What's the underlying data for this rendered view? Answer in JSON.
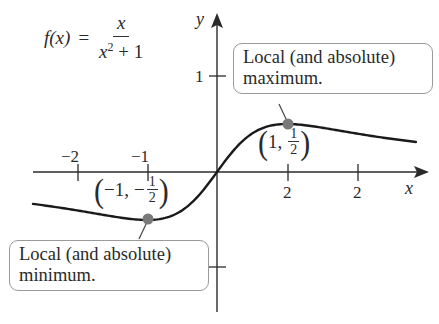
{
  "formula": {
    "lhs": "f(x)",
    "eq": "=",
    "numerator": "x",
    "denominator_base": "x",
    "denominator_exp": "2",
    "denominator_rest": " + 1"
  },
  "axes": {
    "x_label": "x",
    "y_label": "y"
  },
  "ticks": {
    "x": [
      "−2",
      "−1",
      "2",
      "2"
    ],
    "y": [
      "1"
    ]
  },
  "points": {
    "max": {
      "label_x": "1,",
      "label_num": "1",
      "label_den": "2"
    },
    "min": {
      "label_x": "−1,",
      "label_sign": "−",
      "label_num": "1",
      "label_den": "2"
    }
  },
  "callouts": {
    "max": {
      "line1": "Local (and absolute)",
      "line2": "maximum."
    },
    "min": {
      "line1": "Local (and absolute)",
      "line2": "minimum."
    }
  },
  "colors": {
    "curve": "#1a1a1a",
    "axis": "#2a2a2a",
    "point": "#7a7a7a",
    "callout_border": "#9a9a9a"
  },
  "chart_data": {
    "type": "line",
    "xlabel": "x",
    "ylabel": "y",
    "x_tick_labels": [
      "−2",
      "−1",
      "2",
      "2"
    ],
    "x_tick_positions": [
      -2,
      -1,
      1,
      2
    ],
    "y_tick_labels": [
      "1"
    ],
    "y_tick_positions": [
      1,
      -1
    ],
    "xlim": [
      -2.6,
      3.0
    ],
    "ylim": [
      -1.4,
      1.65
    ],
    "grid": false,
    "series": [
      {
        "name": "f(x) = x/(x^2+1)",
        "x": [
          -2.6,
          -2,
          -1.5,
          -1,
          -0.5,
          0,
          0.5,
          1,
          1.5,
          2,
          2.5,
          2.85
        ],
        "y": [
          -0.335,
          -0.4,
          -0.462,
          -0.5,
          -0.4,
          0,
          0.4,
          0.5,
          0.462,
          0.4,
          0.345,
          0.31
        ]
      }
    ],
    "annotations": [
      {
        "point": [
          1,
          0.5
        ],
        "label": "(1, 1/2)",
        "callout": "Local (and absolute) maximum."
      },
      {
        "point": [
          -1,
          -0.5
        ],
        "label": "(−1, −1/2)",
        "callout": "Local (and absolute) minimum."
      }
    ]
  }
}
